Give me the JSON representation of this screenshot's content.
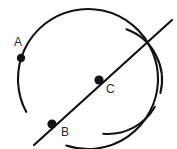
{
  "figure": {
    "background_color": "#ffffff",
    "stroke_color": "#131313",
    "label_color": "#2b2b2b",
    "width": 177,
    "height": 149,
    "points": [
      {
        "id": "A",
        "label": "A",
        "dot_x": 21,
        "dot_y": 58,
        "dot_radius": 4.2,
        "label_x": 14,
        "label_y": 36
      },
      {
        "id": "B",
        "label": "B",
        "dot_x": 52,
        "dot_y": 124,
        "dot_radius": 4.6,
        "label_x": 61,
        "label_y": 126
      },
      {
        "id": "C",
        "label": "C",
        "dot_x": 99,
        "dot_y": 80,
        "dot_radius": 4.6,
        "label_x": 106,
        "label_y": 83
      }
    ],
    "curves": [
      {
        "name": "main-circle-arc",
        "type": "arc",
        "center_x": 88,
        "center_y": 79,
        "radius": 70,
        "start_angle_deg": 152,
        "end_angle_deg": 468
      },
      {
        "name": "secondary-arc-upper",
        "type": "arc",
        "center_x": 108,
        "center_y": 80,
        "radius": 54,
        "start_angle_deg": -70,
        "end_angle_deg": 14
      },
      {
        "name": "secondary-arc-lower",
        "type": "arc",
        "center_x": 108,
        "center_y": 80,
        "radius": 54,
        "start_angle_deg": 30,
        "end_angle_deg": 95
      }
    ],
    "lines": [
      {
        "name": "secant-line",
        "x1": 34,
        "y1": 145,
        "x2": 172,
        "y2": 20
      }
    ]
  }
}
